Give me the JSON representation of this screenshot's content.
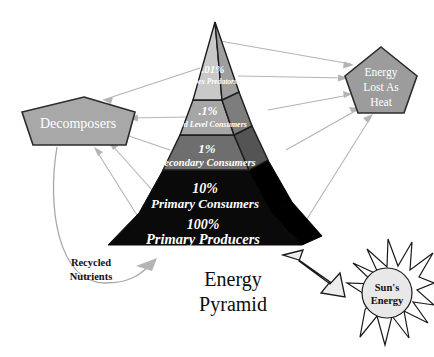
{
  "title": "Energy Pyramid",
  "background_color": "#ffffff",
  "pyramid": {
    "name": "energy-pyramid",
    "tiers": [
      {
        "id": "apex-predators",
        "percent": ".01%",
        "label": "Apex Predators",
        "face_color": "#c9c9c9",
        "side_color": "#9e9e9e"
      },
      {
        "id": "third-level-consumers",
        "percent": ".1%",
        "label": "Third Level Consumers",
        "face_color": "#a6a6a6",
        "side_color": "#7d7d7d"
      },
      {
        "id": "secondary-consumers",
        "percent": "1%",
        "label": "Secondary Consumers",
        "face_color": "#6e6e6e",
        "side_color": "#545454"
      },
      {
        "id": "primary-consumers",
        "percent": "10%",
        "label": "Primary Consumers",
        "face_color": "#0a0a0a",
        "side_color": "#000000"
      },
      {
        "id": "primary-producers",
        "percent": "100%",
        "label": "Primary Producers",
        "face_color": "#0a0a0a",
        "side_color": "#000000"
      }
    ]
  },
  "nodes": {
    "decomposers": {
      "label": "Decomposers",
      "fill": "#a8a8a8",
      "stroke": "#2b2b2b"
    },
    "energy_lost": {
      "lines": [
        "Energy",
        "Lost As",
        "Heat"
      ],
      "fill": "#9c9c9c",
      "stroke": "#2b2b2b"
    },
    "suns_energy": {
      "lines": [
        "Sun's",
        "Energy"
      ],
      "fill": "#e8e8e8",
      "stroke": "#1a1a1a",
      "points": 16
    }
  },
  "annotations": {
    "recycled_nutrients": {
      "lines": [
        "Recycled",
        "Nutrients"
      ]
    }
  },
  "colors": {
    "flow_arrow": "#b4b4b4",
    "text_light": "#ffffff",
    "text_dark": "#111111"
  }
}
